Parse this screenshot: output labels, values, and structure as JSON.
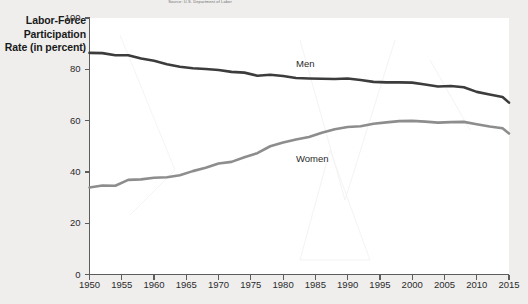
{
  "figure": {
    "source_note": "Source: U.S. Department of Labor",
    "axis_title_lines": [
      "Labor-Force",
      "Participation",
      "Rate (in percent)"
    ]
  },
  "colors": {
    "page_background": "#efeeed",
    "plot_background": "#ffffff",
    "men_line": "#3c3c3c",
    "women_line": "#8d8d8d",
    "axis": "#5d5d5d",
    "text": "#2b2b2b"
  },
  "chart_data": {
    "type": "line",
    "title": "",
    "subtitle": "",
    "xlabel": "",
    "ylabel": "Labor-Force Participation Rate (in percent)",
    "xlim": [
      1950,
      2015
    ],
    "ylim": [
      0,
      100
    ],
    "grid": false,
    "legend": "inline-labels",
    "x_ticks": [
      1950,
      1955,
      1960,
      1965,
      1970,
      1975,
      1980,
      1985,
      1990,
      1995,
      2000,
      2005,
      2010,
      2015
    ],
    "y_ticks": [
      0,
      20,
      40,
      60,
      80,
      100
    ],
    "x": [
      1950,
      1952,
      1954,
      1956,
      1958,
      1960,
      1962,
      1964,
      1966,
      1968,
      1970,
      1972,
      1974,
      1976,
      1978,
      1980,
      1982,
      1984,
      1986,
      1988,
      1990,
      1992,
      1994,
      1996,
      1998,
      2000,
      2002,
      2004,
      2006,
      2008,
      2010,
      2012,
      2014,
      2015
    ],
    "series": [
      {
        "name": "Men",
        "color": "#3c3c3c",
        "label_x": 1982,
        "label_y": 82,
        "values": [
          86.4,
          86.3,
          85.5,
          85.5,
          84.2,
          83.3,
          82.0,
          81.0,
          80.4,
          80.1,
          79.7,
          79.0,
          78.7,
          77.5,
          77.9,
          77.4,
          76.6,
          76.4,
          76.3,
          76.2,
          76.4,
          75.8,
          75.1,
          74.9,
          74.9,
          74.8,
          74.1,
          73.3,
          73.5,
          73.0,
          71.2,
          70.2,
          69.2,
          67.0
        ]
      },
      {
        "name": "Women",
        "color": "#8d8d8d",
        "label_x": 1982,
        "label_y": 45,
        "values": [
          33.9,
          34.7,
          34.6,
          36.9,
          37.1,
          37.7,
          37.9,
          38.7,
          40.3,
          41.6,
          43.3,
          43.9,
          45.7,
          47.3,
          50.0,
          51.5,
          52.6,
          53.6,
          55.3,
          56.6,
          57.5,
          57.8,
          58.8,
          59.3,
          59.8,
          59.9,
          59.6,
          59.2,
          59.4,
          59.5,
          58.6,
          57.7,
          57.0,
          55.0
        ]
      }
    ]
  }
}
